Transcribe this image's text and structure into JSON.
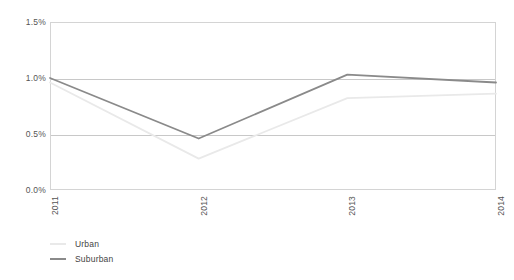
{
  "chart_data": {
    "type": "line",
    "title": "",
    "xlabel": "",
    "ylabel": "",
    "categories": [
      "2011",
      "2012",
      "2013",
      "2014"
    ],
    "ylim": [
      0.0,
      1.5
    ],
    "ytick_labels": [
      "0.0%",
      "0.5%",
      "1.0%",
      "1.5%"
    ],
    "ytick_values": [
      0.0,
      0.5,
      1.0,
      1.5
    ],
    "grid": true,
    "legend_position": "bottom-left",
    "series": [
      {
        "name": "Urban",
        "color": "#e9e9e9",
        "values": [
          0.96,
          0.28,
          0.82,
          0.86
        ]
      },
      {
        "name": "Suburban",
        "color": "#8a8a8a",
        "values": [
          1.0,
          0.46,
          1.03,
          0.96
        ]
      }
    ]
  },
  "legend": {
    "items": [
      {
        "label": "Urban"
      },
      {
        "label": "Suburban"
      }
    ]
  },
  "colors": {
    "urban": "#e9e9e9",
    "suburban": "#8a8a8a",
    "gridline": "#c8c8c8",
    "frame": "#d4d4d4",
    "axis_text": "#555555"
  }
}
